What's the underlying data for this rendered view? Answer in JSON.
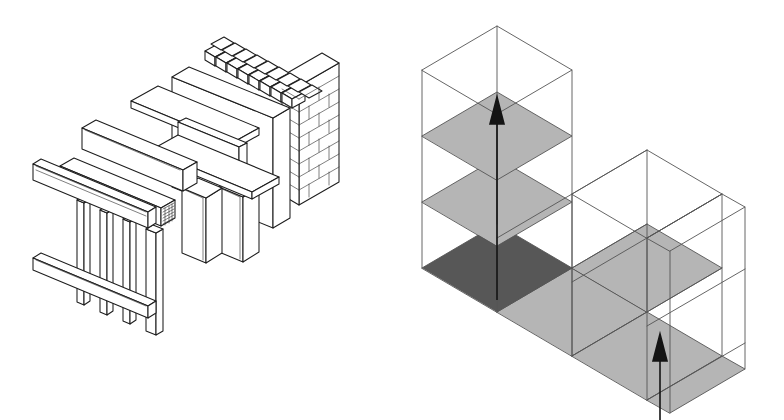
{
  "figure": {
    "background_color": "#ffffff",
    "line_color": "#1d1d1d",
    "thin_line_color": "#3a3a3a",
    "wire_color": "#555555",
    "arrow_color": "#141414",
    "panels": [
      {
        "id": "left",
        "name": "exploded-wall-assembly-diagram"
      },
      {
        "id": "right",
        "name": "isometric-modular-volume-diagram"
      }
    ]
  },
  "left_diagram": {
    "name": "exploded-wall-assembly",
    "projection": "isometric",
    "fill_color": "#ffffff",
    "components": [
      {
        "id": "top-plate",
        "label": "Top plate",
        "material": "timber",
        "order": 1
      },
      {
        "id": "bottom-plate",
        "label": "Bottom plate",
        "material": "timber",
        "order": 2
      },
      {
        "id": "stud-frame",
        "label": "Stud frame",
        "material": "timber",
        "studs": 4,
        "order": 3
      },
      {
        "id": "sheathing-board",
        "label": "Sheathing board",
        "material": "board",
        "order": 4
      },
      {
        "id": "timber-beam",
        "label": "Timber beam",
        "material": "timber",
        "end_grain_hatch": true,
        "order": 5
      },
      {
        "id": "steel-i-beam",
        "label": "Steel I-beam",
        "material": "steel",
        "order": 6
      },
      {
        "id": "column-front",
        "label": "Front column",
        "material": "concrete",
        "order": 7
      },
      {
        "id": "column-rear",
        "label": "Rear column",
        "material": "concrete",
        "order": 8
      },
      {
        "id": "wall-panel",
        "label": "Wall panel",
        "material": "board",
        "order": 9
      },
      {
        "id": "brick-wall",
        "label": "Brick wall",
        "material": "masonry",
        "courses": 9,
        "order": 10
      }
    ]
  },
  "right_diagram": {
    "name": "isometric-modular-volume",
    "projection": "isometric",
    "wire_color": "#555555",
    "cell_size": {
      "half_width": 52,
      "half_height": 30,
      "height": 74
    },
    "shade_colors": {
      "dark": "#575757",
      "light": "#b5b5b5",
      "empty": "#ffffff"
    },
    "tower": {
      "name": "vertical-stack",
      "levels": 3,
      "slabs": [
        {
          "level": 0,
          "shade": "dark",
          "label": "Base slab"
        },
        {
          "level": 1,
          "shade": "light",
          "label": "Second slab"
        },
        {
          "level": 2,
          "shade": "light",
          "label": "Third slab"
        },
        {
          "level": 3,
          "shade": "empty",
          "label": "Open top"
        }
      ]
    },
    "arm": {
      "name": "horizontal-run",
      "bays": 3,
      "slabs": [
        {
          "bay": 1,
          "shade": "light"
        },
        {
          "bay": 2,
          "shade": "light"
        },
        {
          "bay": 3,
          "shade": "light"
        }
      ]
    },
    "arrows": [
      {
        "id": "arrow-vertical-tower",
        "label": "Vertical circulation arrow",
        "direction": "up",
        "color": "#141414"
      },
      {
        "id": "arrow-vertical-arm",
        "label": "Vertical access arrow",
        "direction": "up",
        "color": "#141414"
      }
    ]
  }
}
